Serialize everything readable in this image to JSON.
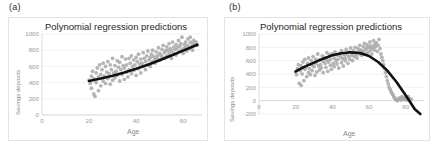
{
  "figure": {
    "background": "#ffffff",
    "panels": [
      {
        "tag": "(a)",
        "title": "Polynomial regression predictions",
        "xlabel": "Age",
        "ylabel": "Savings deposits"
      },
      {
        "tag": "(b)",
        "title": "Polynomial regression predictions",
        "xlabel": "Age",
        "ylabel": "Savings deposits"
      }
    ]
  },
  "chart_data": [
    {
      "type": "scatter",
      "panel": "(a)",
      "title": "Polynomial regression predictions",
      "xlabel": "Age",
      "ylabel": "Savings deposits",
      "xlim": [
        0,
        68
      ],
      "ylim": [
        0,
        1000
      ],
      "xticks": [
        0,
        20,
        40,
        60
      ],
      "yticks": [
        0,
        200,
        400,
        600,
        800,
        1000
      ],
      "grid": "horizontal",
      "legend": "none",
      "point_color": "#a8a8a8",
      "line_color": "#111111",
      "series": [
        {
          "name": "observations",
          "type": "scatter",
          "x": [
            20,
            20.5,
            21,
            21,
            21.5,
            22,
            22,
            22.5,
            23,
            23,
            23.5,
            24,
            24,
            24.5,
            25,
            25,
            25.5,
            26,
            26,
            26.5,
            27,
            27,
            27.5,
            28,
            28,
            28.5,
            29,
            29,
            29.5,
            30,
            30,
            30.5,
            31,
            31,
            31.5,
            32,
            32,
            32.5,
            33,
            33,
            33.5,
            34,
            34,
            34.5,
            35,
            35,
            35.5,
            36,
            36,
            36.5,
            37,
            37,
            37.5,
            38,
            38,
            38.5,
            39,
            39,
            39.5,
            40,
            40,
            40.5,
            41,
            41,
            41.5,
            42,
            42,
            42.5,
            43,
            43,
            43.5,
            44,
            44,
            44.5,
            45,
            45,
            45.5,
            46,
            46,
            46.5,
            47,
            47,
            47.5,
            48,
            48,
            48.5,
            49,
            49,
            49.5,
            50,
            50,
            50.5,
            51,
            51,
            51.5,
            52,
            52,
            52.5,
            53,
            53,
            53.5,
            54,
            54,
            54.5,
            55,
            55,
            55.5,
            56,
            56,
            56.5,
            57,
            57,
            57.5,
            58,
            58,
            58.5,
            59,
            59,
            59.5,
            60,
            60,
            60.5,
            61,
            61,
            61.5,
            62,
            62,
            62.5,
            63,
            63,
            63.5,
            64,
            64,
            64.5,
            65,
            65.5,
            66
          ],
          "y": [
            430,
            390,
            480,
            330,
            540,
            260,
            450,
            230,
            520,
            400,
            580,
            300,
            470,
            620,
            500,
            360,
            560,
            420,
            640,
            480,
            390,
            600,
            530,
            450,
            660,
            510,
            380,
            620,
            560,
            430,
            700,
            520,
            460,
            610,
            540,
            490,
            670,
            590,
            420,
            650,
            560,
            500,
            720,
            610,
            440,
            580,
            690,
            530,
            620,
            470,
            700,
            560,
            640,
            510,
            730,
            600,
            550,
            680,
            620,
            490,
            710,
            660,
            570,
            750,
            630,
            520,
            690,
            640,
            600,
            770,
            700,
            560,
            660,
            730,
            620,
            790,
            680,
            710,
            600,
            750,
            660,
            800,
            720,
            690,
            640,
            780,
            730,
            700,
            830,
            760,
            680,
            740,
            810,
            720,
            860,
            770,
            700,
            790,
            840,
            730,
            800,
            880,
            760,
            820,
            700,
            790,
            900,
            840,
            760,
            810,
            870,
            740,
            830,
            920,
            780,
            850,
            800,
            880,
            960,
            820,
            760,
            870,
            900,
            830,
            790,
            940,
            860,
            820,
            900,
            960,
            840,
            880,
            800,
            920,
            870,
            900,
            860,
            880
          ]
        },
        {
          "name": "polynomial fit",
          "type": "line",
          "x": [
            20,
            25,
            30,
            35,
            40,
            45,
            50,
            55,
            60,
            65,
            66
          ],
          "y": [
            420,
            450,
            485,
            525,
            570,
            620,
            675,
            735,
            795,
            855,
            868
          ]
        }
      ]
    },
    {
      "type": "scatter",
      "panel": "(b)",
      "title": "Polynomial regression predictions",
      "xlabel": "Age",
      "ylabel": "Savings deposits",
      "xlim": [
        0,
        90
      ],
      "ylim": [
        -200,
        1000
      ],
      "xticks": [
        0,
        20,
        40,
        60,
        80
      ],
      "yticks": [
        -200,
        0,
        200,
        400,
        600,
        800,
        1000
      ],
      "grid": "horizontal",
      "legend": "none",
      "point_color": "#a8a8a8",
      "line_color": "#111111",
      "series": [
        {
          "name": "observations",
          "type": "scatter",
          "x": [
            20,
            20.5,
            21,
            21.5,
            22,
            22.5,
            23,
            23,
            23.5,
            24,
            24.5,
            25,
            25,
            25.5,
            26,
            26.5,
            27,
            27,
            27.5,
            28,
            28.5,
            29,
            29,
            29.5,
            30,
            30.5,
            31,
            31,
            31.5,
            32,
            32.5,
            33,
            33,
            33.5,
            34,
            34.5,
            35,
            35,
            35.5,
            36,
            36.5,
            37,
            37,
            37.5,
            38,
            38.5,
            39,
            39,
            39.5,
            40,
            40.5,
            41,
            41,
            41.5,
            42,
            42.5,
            43,
            43,
            43.5,
            44,
            44.5,
            45,
            45,
            45.5,
            46,
            46.5,
            47,
            47,
            47.5,
            48,
            48.5,
            49,
            49,
            49.5,
            50,
            50.5,
            51,
            51,
            51.5,
            52,
            52.5,
            53,
            53,
            53.5,
            54,
            54.5,
            55,
            55,
            55.5,
            56,
            56.5,
            57,
            57,
            57.5,
            58,
            58.5,
            59,
            59,
            59.5,
            60,
            60.5,
            61,
            61,
            61.5,
            62,
            62.5,
            63,
            63,
            63.5,
            64,
            64.5,
            65,
            65.5,
            66,
            66.5,
            67,
            67.5,
            68,
            68.5,
            69,
            69.5,
            70,
            70.5,
            71,
            71.5,
            72,
            72.5,
            73,
            73.5,
            74,
            74.5,
            75,
            75.5,
            76,
            76.5,
            77,
            77.5,
            78,
            78.5,
            79,
            79.5,
            80,
            80.5,
            81,
            81.5,
            82,
            83
          ],
          "y": [
            430,
            390,
            480,
            540,
            260,
            450,
            230,
            520,
            400,
            580,
            300,
            470,
            620,
            500,
            360,
            560,
            420,
            640,
            480,
            390,
            600,
            530,
            450,
            660,
            510,
            380,
            620,
            560,
            430,
            700,
            520,
            460,
            610,
            540,
            490,
            670,
            590,
            420,
            650,
            560,
            500,
            720,
            610,
            440,
            580,
            690,
            530,
            620,
            470,
            700,
            560,
            640,
            510,
            730,
            600,
            550,
            680,
            620,
            490,
            710,
            660,
            570,
            750,
            630,
            520,
            690,
            640,
            600,
            770,
            700,
            560,
            660,
            730,
            620,
            790,
            680,
            710,
            600,
            750,
            660,
            800,
            720,
            690,
            640,
            780,
            730,
            700,
            830,
            760,
            680,
            740,
            810,
            720,
            860,
            770,
            700,
            790,
            840,
            730,
            800,
            880,
            760,
            820,
            700,
            790,
            900,
            840,
            760,
            810,
            870,
            740,
            830,
            920,
            780,
            700,
            650,
            600,
            540,
            480,
            420,
            360,
            300,
            250,
            200,
            170,
            140,
            110,
            90,
            60,
            40,
            20,
            10,
            0,
            20,
            40,
            30,
            10,
            60,
            40,
            20,
            50,
            30,
            10,
            40,
            60,
            30,
            20,
            40
          ]
        },
        {
          "name": "polynomial fit",
          "type": "line",
          "x": [
            20,
            25,
            30,
            35,
            40,
            45,
            50,
            55,
            60,
            65,
            70,
            75,
            80,
            85,
            88
          ],
          "y": [
            440,
            510,
            570,
            630,
            680,
            710,
            725,
            715,
            670,
            580,
            450,
            280,
            80,
            -130,
            -200
          ]
        }
      ]
    }
  ]
}
